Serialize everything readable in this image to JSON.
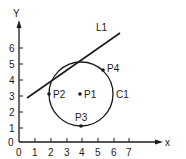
{
  "diagram": {
    "type": "geometry",
    "axes": {
      "x_label": "x",
      "y_label": "Y",
      "x_ticks": [
        "0",
        "1",
        "2",
        "3",
        "4",
        "5",
        "6",
        "7"
      ],
      "y_ticks": [
        "1",
        "2",
        "3",
        "4",
        "5",
        "6"
      ],
      "origin_label": "0"
    },
    "circle": {
      "label": "C1",
      "center": [
        4,
        3
      ],
      "radius": 2
    },
    "line": {
      "label": "L1",
      "start": [
        0.5,
        2.8
      ],
      "end": [
        6.4,
        6.9
      ]
    },
    "points": [
      {
        "label": "P1",
        "x": 4,
        "y": 3
      },
      {
        "label": "P2",
        "x": 2,
        "y": 3
      },
      {
        "label": "P3",
        "x": 4,
        "y": 1
      },
      {
        "label": "P4",
        "x": 5.4,
        "y": 4.4
      }
    ],
    "colors": {
      "ink": "#1a1a1a",
      "background": "#ffffff"
    }
  }
}
